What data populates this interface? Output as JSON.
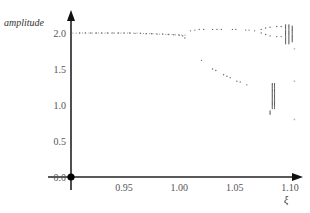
{
  "chart_data": {
    "type": "scatter",
    "title": "",
    "xlabel": "ξ",
    "ylabel": "amplitude",
    "xlim": [
      0.905,
      1.105
    ],
    "ylim": [
      0.0,
      2.2
    ],
    "grid": false,
    "legend": null,
    "x_ticks": [
      {
        "value": 0.95,
        "label": "0.95"
      },
      {
        "value": 1.0,
        "label": "1.00"
      },
      {
        "value": 1.05,
        "label": "1.05"
      },
      {
        "value": 1.1,
        "label": "1.10"
      }
    ],
    "y_ticks": [
      {
        "value": 0.0,
        "label": "0.0"
      },
      {
        "value": 0.5,
        "label": "0.5"
      },
      {
        "value": 1.0,
        "label": "1.0"
      },
      {
        "value": 1.5,
        "label": "1.5"
      },
      {
        "value": 2.0,
        "label": "2.0"
      }
    ],
    "origin_marker": {
      "x": 0.905,
      "y": 0.0
    },
    "series": [
      {
        "name": "period-1 branch",
        "points": [
          [
            0.91,
            2.0
          ],
          [
            0.915,
            2.0
          ],
          [
            0.92,
            2.0
          ],
          [
            0.925,
            2.0
          ],
          [
            0.93,
            2.0
          ],
          [
            0.935,
            2.0
          ],
          [
            0.94,
            2.0
          ],
          [
            0.945,
            2.0
          ],
          [
            0.95,
            2.0
          ],
          [
            0.955,
            2.0
          ],
          [
            0.96,
            1.995
          ],
          [
            0.965,
            1.995
          ],
          [
            0.97,
            1.99
          ],
          [
            0.975,
            1.99
          ],
          [
            0.98,
            1.985
          ],
          [
            0.985,
            1.985
          ],
          [
            0.99,
            1.98
          ],
          [
            0.995,
            1.975
          ],
          [
            1.0,
            1.97
          ],
          [
            1.003,
            1.96
          ],
          [
            1.005,
            1.93
          ]
        ]
      },
      {
        "name": "upper branch",
        "points": [
          [
            1.01,
            2.03
          ],
          [
            1.014,
            2.04
          ],
          [
            1.018,
            2.05
          ],
          [
            1.022,
            2.05
          ],
          [
            1.03,
            2.05
          ],
          [
            1.034,
            2.05
          ],
          [
            1.038,
            2.05
          ],
          [
            1.048,
            2.05
          ],
          [
            1.051,
            2.05
          ],
          [
            1.06,
            2.04
          ],
          [
            1.063,
            2.04
          ],
          [
            1.068,
            2.03
          ],
          [
            1.074,
            2.05
          ],
          [
            1.078,
            2.07
          ],
          [
            1.082,
            2.08
          ],
          [
            1.088,
            2.09
          ],
          [
            1.092,
            2.09
          ],
          [
            1.074,
            2.0
          ],
          [
            1.078,
            1.98
          ],
          [
            1.082,
            1.96
          ],
          [
            1.088,
            1.95
          ],
          [
            1.092,
            1.95
          ]
        ]
      },
      {
        "name": "lower branch",
        "points": [
          [
            1.02,
            1.62
          ],
          [
            1.03,
            1.5
          ],
          [
            1.033,
            1.48
          ],
          [
            1.04,
            1.42
          ],
          [
            1.043,
            1.4
          ],
          [
            1.046,
            1.38
          ],
          [
            1.052,
            1.33
          ],
          [
            1.055,
            1.32
          ],
          [
            1.061,
            1.28
          ]
        ]
      },
      {
        "name": "chaotic band",
        "x_values": [
          1.083,
          1.085,
          1.1
        ],
        "bands": [
          {
            "x": 1.096,
            "y_range": [
              1.85,
              2.12
            ]
          },
          {
            "x": 1.099,
            "y_range": [
              1.85,
              2.12
            ]
          },
          {
            "x": 1.102,
            "y_range": [
              1.88,
              2.1
            ]
          },
          {
            "x": 1.084,
            "y_range": [
              0.95,
              1.3
            ]
          },
          {
            "x": 1.086,
            "y_range": [
              0.95,
              1.3
            ]
          },
          {
            "x": 1.082,
            "y_range": [
              0.87,
              0.92
            ]
          }
        ],
        "isolated_points": [
          [
            1.104,
            1.78
          ],
          [
            1.104,
            1.33
          ],
          [
            1.104,
            0.8
          ]
        ]
      }
    ]
  }
}
